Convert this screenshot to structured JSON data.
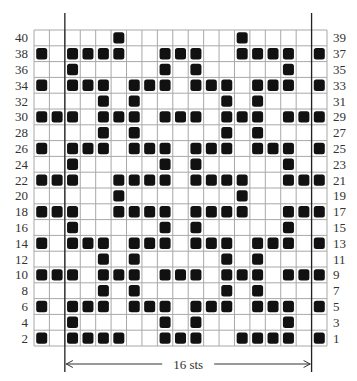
{
  "chart": {
    "columns": 19,
    "rows_total": 40,
    "repeat": {
      "start_col": 3,
      "end_col": 18,
      "label": "16 sts"
    },
    "fill_color": "#111111",
    "left_labels": [
      "40",
      "38",
      "36",
      "34",
      "32",
      "30",
      "28",
      "26",
      "24",
      "22",
      "20",
      "18",
      "16",
      "14",
      "12",
      "10",
      "8",
      "6",
      "4",
      "2"
    ],
    "right_labels": [
      "39",
      "37",
      "35",
      "33",
      "31",
      "29",
      "27",
      "25",
      "23",
      "21",
      "19",
      "17",
      "15",
      "13",
      "11",
      "9",
      "7",
      "5",
      "3",
      "1"
    ],
    "grid_rows": [
      {
        "rows": "40/39",
        "filled": [
          6,
          14
        ]
      },
      {
        "rows": "38/37",
        "filled": [
          1,
          3,
          4,
          5,
          6,
          9,
          10,
          11,
          14,
          15,
          16,
          17,
          19
        ]
      },
      {
        "rows": "36/35",
        "filled": [
          3,
          9,
          11,
          17
        ]
      },
      {
        "rows": "34/33",
        "filled": [
          1,
          3,
          4,
          5,
          7,
          8,
          9,
          11,
          12,
          13,
          15,
          16,
          17,
          19
        ]
      },
      {
        "rows": "32/31",
        "filled": [
          5,
          7,
          13,
          15
        ]
      },
      {
        "rows": "30/29",
        "filled": [
          1,
          2,
          3,
          5,
          6,
          7,
          9,
          10,
          11,
          13,
          14,
          15,
          17,
          18,
          19
        ]
      },
      {
        "rows": "28/27",
        "filled": [
          5,
          7,
          13,
          15
        ]
      },
      {
        "rows": "26/25",
        "filled": [
          1,
          3,
          4,
          5,
          7,
          8,
          9,
          11,
          12,
          13,
          15,
          16,
          17,
          19
        ]
      },
      {
        "rows": "24/23",
        "filled": [
          3,
          9,
          11,
          17
        ]
      },
      {
        "rows": "22/21",
        "filled": [
          1,
          2,
          3,
          6,
          7,
          8,
          9,
          11,
          12,
          13,
          14,
          17,
          18,
          19
        ]
      },
      {
        "rows": "20/19",
        "filled": [
          6,
          14
        ]
      },
      {
        "rows": "18/17",
        "filled": [
          1,
          2,
          3,
          6,
          7,
          8,
          9,
          11,
          12,
          13,
          14,
          17,
          18,
          19
        ]
      },
      {
        "rows": "16/15",
        "filled": [
          3,
          9,
          11,
          17
        ]
      },
      {
        "rows": "14/13",
        "filled": [
          1,
          3,
          4,
          5,
          7,
          8,
          9,
          11,
          12,
          13,
          15,
          16,
          17,
          19
        ]
      },
      {
        "rows": "12/11",
        "filled": [
          5,
          7,
          13,
          15
        ]
      },
      {
        "rows": "10/9",
        "filled": [
          1,
          2,
          3,
          5,
          6,
          7,
          9,
          10,
          11,
          13,
          14,
          15,
          17,
          18,
          19
        ]
      },
      {
        "rows": "8/7",
        "filled": [
          5,
          7,
          13,
          15
        ]
      },
      {
        "rows": "6/5",
        "filled": [
          1,
          3,
          4,
          5,
          7,
          8,
          9,
          11,
          12,
          13,
          15,
          16,
          17,
          19
        ]
      },
      {
        "rows": "4/3",
        "filled": [
          3,
          9,
          11,
          17
        ]
      },
      {
        "rows": "2/1",
        "filled": [
          1,
          3,
          4,
          5,
          6,
          9,
          10,
          11,
          14,
          15,
          16,
          17,
          19
        ]
      }
    ]
  }
}
